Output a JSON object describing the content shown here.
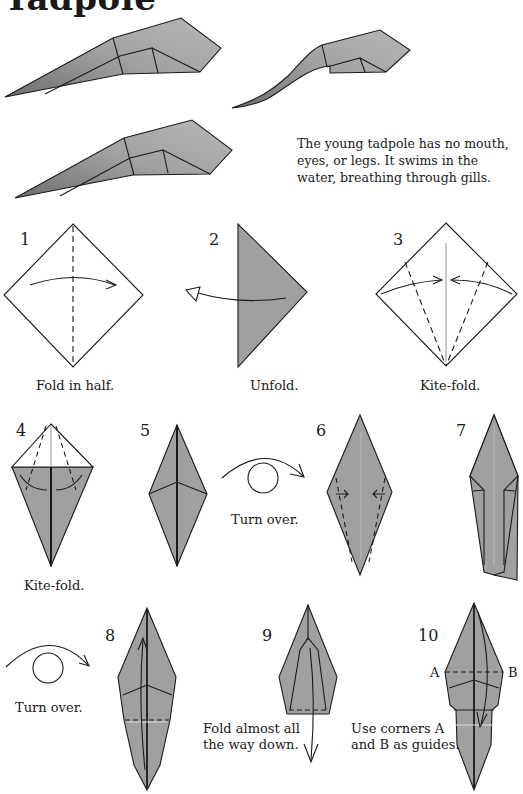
{
  "page": {
    "title": "Tadpole",
    "description": [
      "The young tadpole has no mouth,",
      "eyes, or legs. It swims in the",
      "water, breathing through gills."
    ],
    "paper_color": "#9e9e9e",
    "line_color": "#1a1a1a"
  },
  "steps": [
    {
      "number": "1",
      "caption": "Fold in half."
    },
    {
      "number": "2",
      "caption": "Unfold."
    },
    {
      "number": "3",
      "caption": "Kite-fold."
    },
    {
      "number": "4",
      "caption": "Kite-fold."
    },
    {
      "number": "5",
      "caption": "Turn over."
    },
    {
      "number": "6",
      "caption": ""
    },
    {
      "number": "7",
      "caption": "Turn over."
    },
    {
      "number": "8",
      "caption": ""
    },
    {
      "number": "9",
      "caption_lines": [
        "Fold almost all",
        "the way down."
      ]
    },
    {
      "number": "10",
      "caption_lines": [
        "Use corners A",
        "and B as guides."
      ],
      "labels": [
        "A",
        "B"
      ]
    }
  ]
}
